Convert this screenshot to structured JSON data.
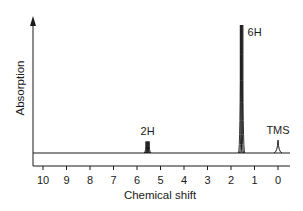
{
  "chart_data": {
    "type": "line",
    "title": "",
    "xlabel": "Chemical shift",
    "ylabel": "Absorption",
    "x_reversed": true,
    "xlim": [
      10.5,
      -0.3
    ],
    "ylim": [
      0,
      1
    ],
    "x_ticks": [
      10,
      9,
      8,
      7,
      6,
      5,
      4,
      3,
      2,
      1,
      0
    ],
    "x_tick_labels": [
      "10",
      "9",
      "8",
      "7",
      "6",
      "5",
      "4",
      "3",
      "2",
      "1",
      "0"
    ],
    "grid": false,
    "legend": "none",
    "peaks": [
      {
        "name": "vinyl",
        "label": "2H",
        "shift": 5.55,
        "height": 0.09,
        "multiplet": true
      },
      {
        "name": "methyl",
        "label": "6H",
        "shift": 1.55,
        "height": 1.0,
        "multiplet": true
      },
      {
        "name": "tms",
        "label": "TMS",
        "shift": 0.0,
        "height": 0.1,
        "multiplet": false
      }
    ],
    "colors": {
      "line": "#1a1a1a",
      "axis": "#1a1a1a"
    }
  }
}
